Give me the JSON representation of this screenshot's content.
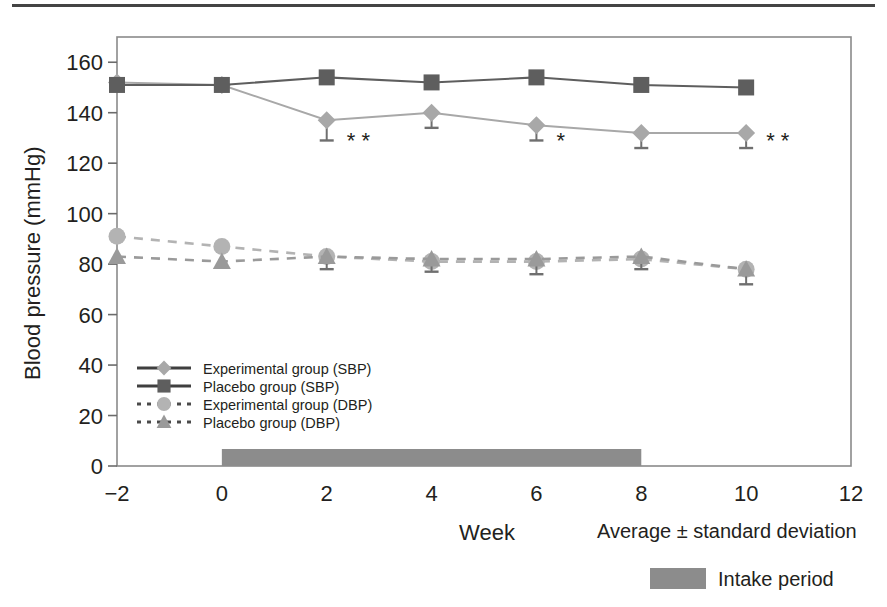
{
  "figure": {
    "top_rule": "horizontal-rule",
    "axis_title_y": "Blood pressure (mmHg)",
    "axis_title_x": "Week",
    "note_average": "Average ± standard deviation",
    "note_intake": "Intake period",
    "colors": {
      "experimental_sbp": "#a8a8a8",
      "placebo_sbp": "#5e5e5e",
      "experimental_dbp": "#b3b3b3",
      "placebo_dbp": "#9a9a9a",
      "intake_bar": "#8c8c8c",
      "axis": "#6b6b6b",
      "text": "#231f20"
    }
  },
  "chart_data": {
    "type": "line",
    "title": "",
    "xlabel": "Week",
    "ylabel": "Blood pressure (mmHg)",
    "xlim": [
      -2,
      12
    ],
    "ylim": [
      0,
      170
    ],
    "xticks": [
      -2,
      0,
      2,
      4,
      6,
      8,
      10,
      12
    ],
    "yticks": [
      0,
      20,
      40,
      60,
      80,
      100,
      120,
      140,
      160
    ],
    "grid": false,
    "legend_position": "inside-lower-left",
    "x": [
      -2,
      0,
      2,
      4,
      6,
      8,
      10
    ],
    "series": [
      {
        "name": "Experimental group (SBP)",
        "marker": "diamond",
        "linestyle": "solid",
        "color": "#a8a8a8",
        "values": [
          152,
          151,
          137,
          140,
          135,
          132,
          132
        ],
        "errors": [
          0,
          0,
          8,
          6,
          6,
          6,
          6
        ]
      },
      {
        "name": "Placebo group (SBP)",
        "marker": "square",
        "linestyle": "solid",
        "color": "#5e5e5e",
        "values": [
          151,
          151,
          154,
          152,
          154,
          151,
          150
        ],
        "errors": [
          0,
          0,
          0,
          0,
          0,
          0,
          0
        ]
      },
      {
        "name": "Experimental group (DBP)",
        "marker": "circle",
        "linestyle": "dashed",
        "color": "#b3b3b3",
        "values": [
          91,
          87,
          83,
          81,
          81,
          82,
          78
        ],
        "errors": [
          0,
          0,
          0,
          0,
          0,
          0,
          0
        ]
      },
      {
        "name": "Placebo group (DBP)",
        "marker": "triangle",
        "linestyle": "dashed",
        "color": "#9a9a9a",
        "values": [
          83,
          81,
          83,
          82,
          82,
          83,
          78
        ],
        "errors": [
          0,
          0,
          5,
          5,
          6,
          5,
          6
        ]
      }
    ],
    "annotations": [
      {
        "x": 2,
        "y": 126,
        "text": "* *",
        "meaning": "significance-markers"
      },
      {
        "x": 6,
        "y": 126,
        "text": "*",
        "meaning": "significance-marker"
      },
      {
        "x": 10,
        "y": 126,
        "text": "* *",
        "meaning": "significance-markers"
      }
    ],
    "spans": [
      {
        "name": "Intake period",
        "x_start": 0,
        "x_end": 8,
        "color": "#8c8c8c"
      }
    ]
  },
  "legend": {
    "items": [
      {
        "label": "Experimental group (SBP)",
        "marker": "diamond",
        "linestyle": "solid",
        "color": "#a8a8a8"
      },
      {
        "label": "Placebo group (SBP)",
        "marker": "square",
        "linestyle": "solid",
        "color": "#5e5e5e"
      },
      {
        "label": "Experimental group (DBP)",
        "marker": "circle",
        "linestyle": "dashed",
        "color": "#b3b3b3"
      },
      {
        "label": "Placebo group (DBP)",
        "marker": "triangle",
        "linestyle": "dashed",
        "color": "#9a9a9a"
      }
    ]
  },
  "axis_labels": {
    "x": [
      "−2",
      "0",
      "2",
      "4",
      "6",
      "8",
      "10",
      "12"
    ],
    "y": [
      "0",
      "20",
      "40",
      "60",
      "80",
      "100",
      "120",
      "140",
      "160"
    ]
  }
}
